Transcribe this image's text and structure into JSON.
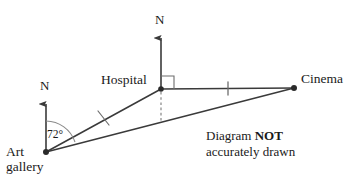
{
  "figure": {
    "type": "bearings-geometry-diagram",
    "note_line1_prefix": "Diagram ",
    "note_line1_bold": "NOT",
    "note_line2": "accurately drawn",
    "stroke_color": "#3a3a3a",
    "text_color": "#1a1a1a",
    "background_color": "#ffffff"
  },
  "points": [
    {
      "id": "art-gallery",
      "label_line1": "Art",
      "label_line2": "gallery",
      "x": 46,
      "y": 152
    },
    {
      "id": "hospital",
      "label": "Hospital",
      "x": 161,
      "y": 89
    },
    {
      "id": "cinema",
      "label": "Cinema",
      "x": 294,
      "y": 88
    }
  ],
  "north_arrows": [
    {
      "id": "north-art-gallery",
      "label": "N",
      "base_x": 46,
      "base_y": 152,
      "tip_y": 100
    },
    {
      "id": "north-hospital",
      "label": "N",
      "base_x": 161,
      "base_y": 89,
      "tip_y": 34
    }
  ],
  "segments": [
    {
      "id": "art-gallery-to-hospital",
      "from": "art-gallery",
      "to": "hospital",
      "tick_marks": 1
    },
    {
      "id": "hospital-to-cinema",
      "from": "hospital",
      "to": "cinema",
      "tick_marks": 1
    },
    {
      "id": "art-gallery-to-cinema",
      "from": "art-gallery",
      "to": "cinema",
      "tick_marks": 0
    }
  ],
  "dashed_segments": [
    {
      "id": "hospital-vertical-dashed",
      "x": 161,
      "y_top": 89,
      "y_bottom": 125
    }
  ],
  "angles": [
    {
      "id": "bearing-angle-at-art-gallery",
      "label": "72°",
      "value": 72,
      "unit": "degrees",
      "vertex": "art-gallery",
      "from_ray": "north-art-gallery",
      "to_ray": "art-gallery-to-hospital"
    },
    {
      "id": "right-angle-at-hospital",
      "label": "",
      "value": 90,
      "unit": "degrees",
      "vertex": "hospital",
      "marker": "square",
      "from_ray": "north-hospital",
      "to_ray": "hospital-to-cinema"
    }
  ]
}
